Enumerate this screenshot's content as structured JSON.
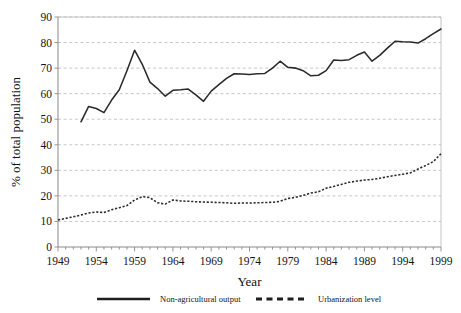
{
  "chart_data": {
    "type": "line",
    "title": "",
    "xlabel": "Year",
    "ylabel": "% of total population",
    "xlim": [
      1949,
      1999
    ],
    "ylim": [
      0,
      90
    ],
    "xticks": [
      1949,
      1954,
      1959,
      1964,
      1969,
      1974,
      1979,
      1984,
      1989,
      1994,
      1999
    ],
    "yticks": [
      0,
      10,
      20,
      30,
      40,
      50,
      60,
      70,
      80,
      90
    ],
    "grid": "horizontal-dashed",
    "legend_position": "bottom",
    "series": [
      {
        "name": "Non-agricultural output",
        "style": "solid",
        "color": "#2b2b2b",
        "x": [
          1952,
          1953,
          1954,
          1955,
          1956,
          1957,
          1958,
          1959,
          1960,
          1961,
          1962,
          1963,
          1964,
          1965,
          1966,
          1967,
          1968,
          1969,
          1970,
          1971,
          1972,
          1973,
          1974,
          1975,
          1976,
          1977,
          1978,
          1979,
          1980,
          1981,
          1982,
          1983,
          1984,
          1985,
          1986,
          1987,
          1988,
          1989,
          1990,
          1991,
          1992,
          1993,
          1994,
          1995,
          1996,
          1997,
          1998,
          1999
        ],
        "values": [
          49.0,
          55.0,
          54.2,
          52.6,
          57.5,
          61.5,
          69.0,
          77.0,
          71.5,
          64.5,
          62.0,
          59.0,
          61.3,
          61.5,
          61.8,
          59.5,
          57.0,
          61.0,
          63.5,
          66.0,
          67.8,
          67.7,
          67.5,
          67.8,
          67.9,
          70.0,
          72.7,
          70.3,
          70.0,
          69.0,
          67.0,
          67.2,
          69.0,
          73.2,
          73.0,
          73.3,
          75.0,
          76.3,
          72.7,
          75.0,
          77.8,
          80.5,
          80.3,
          80.2,
          79.8,
          81.5,
          83.5,
          85.3
        ]
      },
      {
        "name": "Urbanization level",
        "style": "dashed",
        "color": "#2b2b2b",
        "x": [
          1949,
          1950,
          1951,
          1952,
          1953,
          1954,
          1955,
          1956,
          1957,
          1958,
          1959,
          1960,
          1961,
          1962,
          1963,
          1964,
          1965,
          1966,
          1967,
          1968,
          1969,
          1970,
          1971,
          1972,
          1973,
          1974,
          1975,
          1976,
          1977,
          1978,
          1979,
          1980,
          1981,
          1982,
          1983,
          1984,
          1985,
          1986,
          1987,
          1988,
          1989,
          1990,
          1991,
          1992,
          1993,
          1994,
          1995,
          1996,
          1997,
          1998,
          1999
        ],
        "values": [
          10.6,
          11.2,
          11.8,
          12.5,
          13.3,
          13.7,
          13.5,
          14.6,
          15.4,
          16.2,
          18.4,
          19.7,
          19.3,
          17.3,
          16.8,
          18.4,
          18.0,
          17.9,
          17.7,
          17.6,
          17.5,
          17.4,
          17.3,
          17.1,
          17.2,
          17.2,
          17.3,
          17.4,
          17.5,
          17.9,
          19.0,
          19.4,
          20.2,
          21.1,
          21.6,
          23.0,
          23.7,
          24.5,
          25.3,
          25.8,
          26.2,
          26.4,
          26.9,
          27.5,
          28.0,
          28.5,
          29.0,
          30.5,
          31.9,
          33.4,
          36.5
        ]
      }
    ]
  },
  "legend": {
    "entries": [
      {
        "label": "Non-agricultural output",
        "style": "solid"
      },
      {
        "label": "Urbanization level",
        "style": "dashed"
      }
    ]
  },
  "axes": {
    "y_title": "% of total population",
    "x_title": "Year"
  }
}
